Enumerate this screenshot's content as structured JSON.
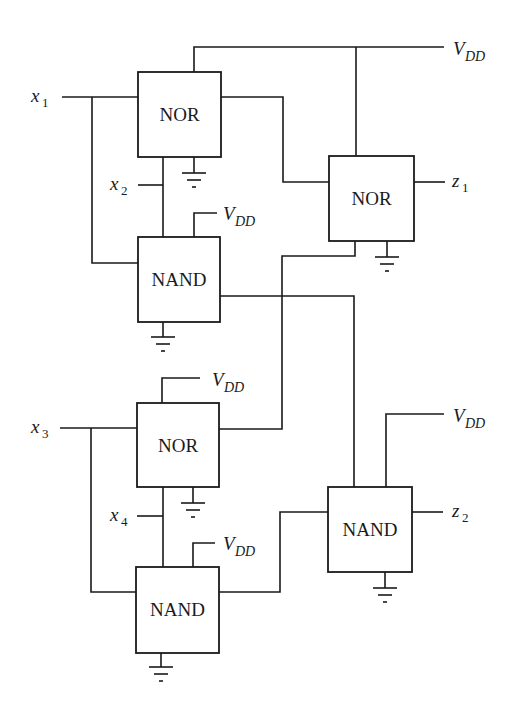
{
  "diagram": {
    "type": "logic-circuit",
    "gates": [
      {
        "id": "nor1",
        "label": "NOR"
      },
      {
        "id": "nor2",
        "label": "NOR"
      },
      {
        "id": "nand1",
        "label": "NAND"
      },
      {
        "id": "nor3",
        "label": "NOR"
      },
      {
        "id": "nand3",
        "label": "NAND"
      },
      {
        "id": "nand4",
        "label": "NAND"
      }
    ],
    "inputs": [
      {
        "id": "x1",
        "var": "x",
        "sub": "1"
      },
      {
        "id": "x2",
        "var": "x",
        "sub": "2"
      },
      {
        "id": "x3",
        "var": "x",
        "sub": "3"
      },
      {
        "id": "x4",
        "var": "x",
        "sub": "4"
      }
    ],
    "outputs": [
      {
        "id": "z1",
        "var": "z",
        "sub": "1"
      },
      {
        "id": "z2",
        "var": "z",
        "sub": "2"
      }
    ],
    "supply": {
      "var": "V",
      "sub": "DD"
    },
    "supply_labels_count": 5,
    "ground_symbols_count": 6
  }
}
